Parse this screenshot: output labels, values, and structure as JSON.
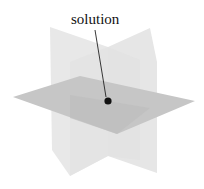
{
  "diagram": {
    "type": "three-planes-intersection",
    "label": "solution",
    "label_position": {
      "x": 71,
      "y": 12
    },
    "colors": {
      "background": "#ffffff",
      "vertical_plane": "#e6e6e6",
      "vertical_plane_overlap": "#dcdcdc",
      "horizontal_plane": "#c4c4c4",
      "horizontal_plane_front": "#bdbdbd",
      "point": "#111111",
      "leader_line": "#222222"
    },
    "planes": [
      {
        "name": "vertical-plane-left",
        "points": "50,27 108,47 108,156 70,176 70,62"
      },
      {
        "name": "vertical-plane-right",
        "points": "108,47 150,28 157,62 157,173 108,156"
      },
      {
        "name": "horizontal-plane",
        "points": "13,97 80,76 195,101 117,134"
      }
    ],
    "point": {
      "cx": 108,
      "cy": 101,
      "r": 3.6
    },
    "leader": {
      "x1": 95,
      "y1": 30,
      "x2": 106,
      "y2": 97
    }
  }
}
